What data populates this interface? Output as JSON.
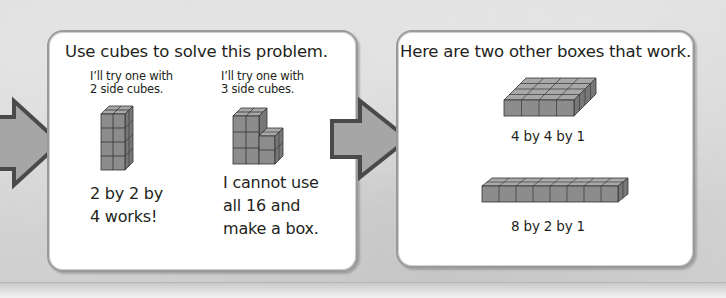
{
  "panel_left": {
    "title": "Use cubes to solve this problem.",
    "try_two": {
      "caption": "I’ll try one with\n2 side cubes.",
      "result": "2 by 2 by\n4 works!"
    },
    "try_three": {
      "caption": "I’ll try one with\n3 side cubes.",
      "result": "I cannot use\nall 16 and\nmake a box."
    }
  },
  "panel_right": {
    "title": "Here are two other boxes that work.",
    "box_one": {
      "label": "4 by 4 by 1"
    },
    "box_two": {
      "label": "8 by 2 by 1"
    }
  },
  "colors": {
    "cube_front": "#8c8c8c",
    "cube_top": "#a8a8a8",
    "cube_side": "#777777",
    "arrow_fill": "#a6a6a6",
    "arrow_stroke": "#4a4a4a",
    "panel_border": "#9a9a9a"
  }
}
